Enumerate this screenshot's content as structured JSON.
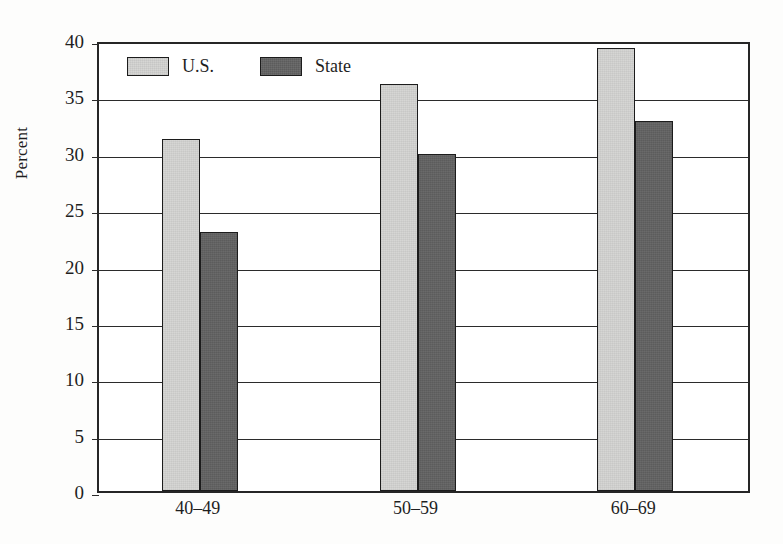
{
  "chart_data": {
    "type": "bar",
    "title": "",
    "subtitle": "",
    "xlabel": "",
    "ylabel": "Percent",
    "categories": [
      "40–49",
      "50–59",
      "60–69"
    ],
    "series": [
      {
        "name": "U.S.",
        "values": [
          31.2,
          36.1,
          39.3
        ],
        "color": "#d6d6d4"
      },
      {
        "name": "State",
        "values": [
          23.0,
          29.9,
          32.8
        ],
        "color": "#5c5c5c"
      }
    ],
    "ylim": [
      0,
      40
    ],
    "ytick_values": [
      0,
      5,
      10,
      15,
      20,
      25,
      30,
      35,
      40
    ],
    "ytick_labels": [
      "0",
      "5",
      "10",
      "15",
      "20",
      "25",
      "30",
      "35",
      "40"
    ],
    "grid": true,
    "grid_axis": "y",
    "legend_position": "inside top-left",
    "annotations": [],
    "background_color": "#ffffff",
    "axis_color": "#262626"
  },
  "legend": {
    "items": [
      {
        "label": "U.S.",
        "swatch": "legend-swatch-us"
      },
      {
        "label": "State",
        "swatch": "legend-swatch-state"
      }
    ]
  },
  "axes": {
    "y_title": "Percent",
    "y_ticks": [
      "40",
      "35",
      "30",
      "25",
      "20",
      "15",
      "10",
      "5",
      "0"
    ],
    "x_ticks": [
      "40–49",
      "50–59",
      "60–69"
    ]
  }
}
